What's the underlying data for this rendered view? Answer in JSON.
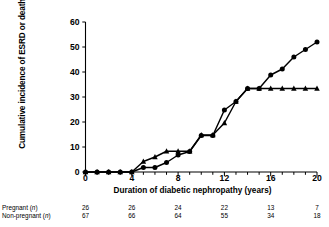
{
  "chart_data": {
    "type": "line",
    "title": "",
    "xlabel": "Duration of diabetic nephropathy (years)",
    "ylabel": "Cumulative incidence of ESRD or death (%)",
    "xlim": [
      0,
      20
    ],
    "ylim": [
      0,
      60
    ],
    "xticks": [
      0,
      4,
      8,
      12,
      16,
      20
    ],
    "yticks": [
      0,
      10,
      20,
      30,
      40,
      50,
      60
    ],
    "xtick_labels": [
      "0",
      "4",
      "8",
      "12",
      "16",
      "20"
    ],
    "ytick_labels": [
      "0",
      "10",
      "20",
      "30",
      "40",
      "50",
      "60"
    ],
    "grid": false,
    "legend": "none",
    "x": [
      0,
      1,
      2,
      3,
      4,
      5,
      6,
      7,
      8,
      9,
      10,
      11,
      12,
      13,
      14,
      15,
      16,
      17,
      18,
      19,
      20
    ],
    "series": [
      {
        "name": "Pregnant",
        "marker": "circle",
        "color": "#000000",
        "values": [
          0,
          0,
          0,
          0,
          0,
          1.8,
          1.8,
          3.8,
          6.8,
          8.2,
          14.6,
          14.6,
          24.8,
          28.2,
          33.4,
          33.4,
          38.8,
          41.2,
          46.0,
          49.0,
          52.0
        ]
      },
      {
        "name": "Non-pregnant",
        "marker": "triangle",
        "color": "#000000",
        "values": [
          0,
          0,
          0,
          0,
          0,
          4.2,
          6.0,
          8.3,
          8.3,
          8.3,
          14.8,
          14.8,
          19.6,
          28.2,
          33.4,
          33.4,
          33.4,
          33.4,
          33.4,
          33.4,
          33.4
        ]
      }
    ]
  },
  "risk_table": {
    "row_labels": [
      "Pregnant (n)",
      "Non-pregnant (n)"
    ],
    "columns": [
      0,
      4,
      8,
      12,
      16,
      20
    ],
    "rows": [
      {
        "label": "Pregnant (n)",
        "values": [
          "26",
          "26",
          "24",
          "22",
          "13",
          "7"
        ]
      },
      {
        "label": "Non-pregnant (n)",
        "values": [
          "67",
          "66",
          "64",
          "55",
          "34",
          "18"
        ]
      }
    ]
  }
}
